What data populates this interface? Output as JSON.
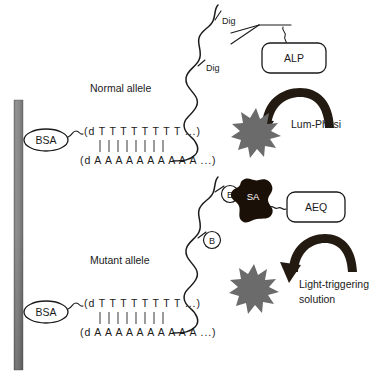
{
  "figure": {
    "background_color": "#ffffff",
    "width": 386,
    "height": 379
  },
  "colors": {
    "ink": "#1a1a1a",
    "support_bar_top": "#7d7d7d",
    "support_bar_mid": "#8f8f8f",
    "support_bar_bottom": "#595959",
    "starburst": "#6b6b6b",
    "streptavidin": "#1a1008",
    "arrow": "#231a12",
    "box_fill": "#ffffff"
  },
  "panels": [
    {
      "id": "normal",
      "allele_label": "Normal allele",
      "carrier_label": "BSA",
      "probe_top": "(d T T T T T T T T ...)",
      "probe_bottom": "(d A A A A A A A A A A ...)",
      "tag_labels": [
        "Dig",
        "Dig"
      ],
      "enzyme_label": "ALP",
      "substrate_label": "Lum-Phosi",
      "recognition_element": "anti-Dig antibody",
      "signal_shape": "starburst"
    },
    {
      "id": "mutant",
      "allele_label": "Mutant allele",
      "carrier_label": "BSA",
      "probe_top": "(d T T T T T T T T ...)",
      "probe_bottom": "(d A A A A A A A A A A ...)",
      "tag_labels": [
        "B",
        "B"
      ],
      "binder_label": "SA",
      "enzyme_label": "AEQ",
      "substrate_label_line1": "Light-triggering",
      "substrate_label_line2": "solution",
      "recognition_element": "streptavidin",
      "signal_shape": "starburst"
    }
  ]
}
